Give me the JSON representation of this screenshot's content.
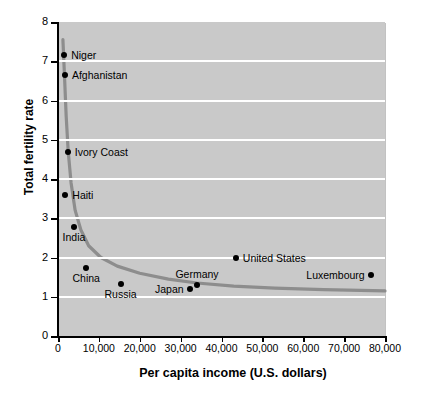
{
  "chart_data": {
    "type": "scatter",
    "title": "",
    "xlabel": "Per capita income (U.S. dollars)",
    "ylabel": "Total fertility rate",
    "xlim": [
      0,
      80000
    ],
    "ylim": [
      0,
      8
    ],
    "xticks": [
      "0",
      "10,000",
      "20,000",
      "30,000",
      "40,000",
      "50,000",
      "60,000",
      "70,000",
      "80,000"
    ],
    "xtick_values": [
      0,
      10000,
      20000,
      30000,
      40000,
      50000,
      60000,
      70000,
      80000
    ],
    "yticks": [
      "0",
      "1",
      "2",
      "3",
      "4",
      "5",
      "6",
      "7",
      "8"
    ],
    "ytick_values": [
      0,
      1,
      2,
      3,
      4,
      5,
      6,
      7,
      8
    ],
    "grid": "horizontal",
    "grid_color": "#ffffff",
    "plot_background": "#c9c9c9",
    "point_color": "#000000",
    "curve_color": "#8d8d8d",
    "legend": "none",
    "points": [
      {
        "label": "Niger",
        "x": 1500,
        "y": 7.15,
        "label_pos": "right"
      },
      {
        "label": "Afghanistan",
        "x": 1700,
        "y": 6.65,
        "label_pos": "right"
      },
      {
        "label": "Ivory Coast",
        "x": 2400,
        "y": 4.7,
        "label_pos": "right"
      },
      {
        "label": "Haiti",
        "x": 1800,
        "y": 3.58,
        "label_pos": "right"
      },
      {
        "label": "India",
        "x": 3900,
        "y": 2.77,
        "label_pos": "below"
      },
      {
        "label": "China",
        "x": 6900,
        "y": 1.73,
        "label_pos": "below"
      },
      {
        "label": "Russia",
        "x": 15300,
        "y": 1.32,
        "label_pos": "below"
      },
      {
        "label": "Japan",
        "x": 32200,
        "y": 1.19,
        "label_pos": "left"
      },
      {
        "label": "Germany",
        "x": 34000,
        "y": 1.3,
        "label_pos": "above"
      },
      {
        "label": "United States",
        "x": 43500,
        "y": 2.0,
        "label_pos": "right"
      },
      {
        "label": "Luxembourg",
        "x": 76500,
        "y": 1.55,
        "label_pos": "left"
      }
    ],
    "trend_curve": {
      "description": "Decreasing hyperbolic fit of fertility rate versus per capita income",
      "points": [
        {
          "x": 1200,
          "y": 7.55
        },
        {
          "x": 1600,
          "y": 6.6
        },
        {
          "x": 2000,
          "y": 5.6
        },
        {
          "x": 2500,
          "y": 4.7
        },
        {
          "x": 3200,
          "y": 3.9
        },
        {
          "x": 4200,
          "y": 3.2
        },
        {
          "x": 5600,
          "y": 2.7
        },
        {
          "x": 7500,
          "y": 2.3
        },
        {
          "x": 10500,
          "y": 2.0
        },
        {
          "x": 14500,
          "y": 1.78
        },
        {
          "x": 20000,
          "y": 1.6
        },
        {
          "x": 27000,
          "y": 1.45
        },
        {
          "x": 34000,
          "y": 1.35
        },
        {
          "x": 43000,
          "y": 1.27
        },
        {
          "x": 53000,
          "y": 1.22
        },
        {
          "x": 65000,
          "y": 1.18
        },
        {
          "x": 80000,
          "y": 1.15
        }
      ]
    }
  }
}
